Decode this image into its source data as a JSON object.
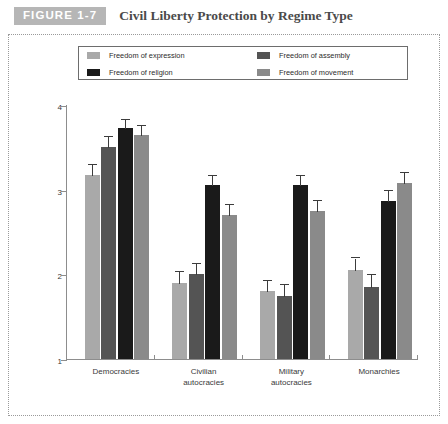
{
  "header": {
    "badge": "FIGURE 1-7",
    "title": "Civil Liberty Protection by Regime Type"
  },
  "legend": {
    "items": [
      {
        "label": "Freedom of expression",
        "color": "#a9a9a9",
        "swatch_name": "legend-swatch-expression"
      },
      {
        "label": "Freedom of assembly",
        "color": "#545454",
        "swatch_name": "legend-swatch-assembly"
      },
      {
        "label": "Freedom of religion",
        "color": "#1a1a1a",
        "swatch_name": "legend-swatch-religion"
      },
      {
        "label": "Freedom of movement",
        "color": "#8a8a8a",
        "swatch_name": "legend-swatch-movement"
      }
    ]
  },
  "axes": {
    "y_title": "Average scores",
    "y_ticks": [
      "1",
      "2",
      "3",
      "4"
    ],
    "y_min": 1,
    "y_max": 4
  },
  "chart_data": {
    "type": "bar",
    "title": "Civil Liberty Protection by Regime Type",
    "xlabel": "",
    "ylabel": "Average scores",
    "ylim": [
      1,
      4
    ],
    "yticks": [
      1,
      2,
      3,
      4
    ],
    "grid": false,
    "legend_position": "top",
    "error_bars": true,
    "categories": [
      "Democracies",
      "Civilian autocracies",
      "Military autocracies",
      "Monarchies"
    ],
    "category_lines": [
      [
        "Democracies"
      ],
      [
        "Civilian",
        "autocracies"
      ],
      [
        "Military",
        "autocracies"
      ],
      [
        "Monarchies"
      ]
    ],
    "series": [
      {
        "name": "Freedom of expression",
        "color": "#a9a9a9",
        "values": [
          3.17,
          1.9,
          1.8,
          2.05
        ],
        "errors": [
          0.07,
          0.08,
          0.08,
          0.09
        ]
      },
      {
        "name": "Freedom of assembly",
        "color": "#545454",
        "values": [
          3.5,
          2.0,
          1.75,
          1.85
        ],
        "errors": [
          0.07,
          0.08,
          0.08,
          0.09
        ]
      },
      {
        "name": "Freedom of religion",
        "color": "#1a1a1a",
        "values": [
          3.73,
          3.05,
          3.05,
          2.87
        ],
        "errors": [
          0.05,
          0.07,
          0.07,
          0.07
        ]
      },
      {
        "name": "Freedom of movement",
        "color": "#8a8a8a",
        "values": [
          3.65,
          2.7,
          2.75,
          3.08
        ],
        "errors": [
          0.06,
          0.07,
          0.07,
          0.07
        ]
      }
    ]
  }
}
